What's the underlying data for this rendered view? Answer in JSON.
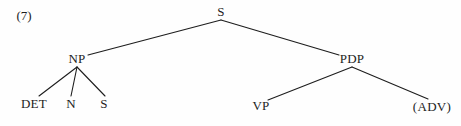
{
  "figure": {
    "example_number": "(7)",
    "background_color": "#fefefe",
    "ink_color": "#1d1d1d",
    "width": 461,
    "height": 126
  },
  "tree": {
    "nodes": [
      {
        "id": "S_root",
        "label": "S",
        "x": 221,
        "y": 11,
        "role": "root"
      },
      {
        "id": "NP",
        "label": "NP",
        "x": 77,
        "y": 58,
        "role": "nonterminal"
      },
      {
        "id": "PDP",
        "label": "PDP",
        "x": 352,
        "y": 58,
        "role": "nonterminal"
      },
      {
        "id": "DET",
        "label": "DET",
        "x": 34,
        "y": 103,
        "role": "terminal"
      },
      {
        "id": "N",
        "label": "N",
        "x": 71,
        "y": 103,
        "role": "terminal"
      },
      {
        "id": "S_leaf",
        "label": "S",
        "x": 104,
        "y": 103,
        "role": "terminal"
      },
      {
        "id": "VP",
        "label": "VP",
        "x": 261,
        "y": 105,
        "role": "terminal"
      },
      {
        "id": "ADV",
        "label": "(ADV)",
        "x": 432,
        "y": 106,
        "role": "terminal"
      }
    ],
    "edges": [
      {
        "from": "S_root",
        "to": "NP",
        "x1": 221,
        "y1": 20,
        "x2": 88,
        "y2": 55
      },
      {
        "from": "S_root",
        "to": "PDP",
        "x1": 221,
        "y1": 20,
        "x2": 339,
        "y2": 55
      },
      {
        "from": "NP",
        "to": "DET",
        "x1": 77,
        "y1": 67,
        "x2": 39,
        "y2": 96
      },
      {
        "from": "NP",
        "to": "N",
        "x1": 77,
        "y1": 67,
        "x2": 71,
        "y2": 96
      },
      {
        "from": "NP",
        "to": "S_leaf",
        "x1": 77,
        "y1": 67,
        "x2": 105,
        "y2": 96
      },
      {
        "from": "PDP",
        "to": "VP",
        "x1": 352,
        "y1": 67,
        "x2": 268,
        "y2": 100
      },
      {
        "from": "PDP",
        "to": "ADV",
        "x1": 352,
        "y1": 67,
        "x2": 428,
        "y2": 99
      }
    ]
  }
}
